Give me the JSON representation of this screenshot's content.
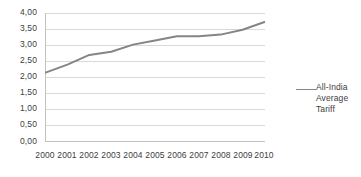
{
  "chart_data": {
    "type": "line",
    "title": "",
    "xlabel": "",
    "ylabel": "",
    "x": [
      2000,
      2001,
      2002,
      2003,
      2004,
      2005,
      2006,
      2007,
      2008,
      2009,
      2010
    ],
    "categories": [
      "2000",
      "2001",
      "2002",
      "2003",
      "2004",
      "2005",
      "2006",
      "2007",
      "2008",
      "2009",
      "2010"
    ],
    "series": [
      {
        "name": "All-India Average Tariff",
        "values": [
          2.15,
          2.4,
          2.7,
          2.8,
          3.02,
          3.15,
          3.28,
          3.28,
          3.33,
          3.48,
          3.72
        ],
        "color": "#858585"
      }
    ],
    "ylim": [
      0,
      4
    ],
    "ytick_step": 0.5,
    "ytick_labels": [
      "4,00",
      "3,50",
      "3,00",
      "2,50",
      "2,00",
      "1,50",
      "1,00",
      "0,50",
      "0,00"
    ],
    "ytick_values": [
      4.0,
      3.5,
      3.0,
      2.5,
      2.0,
      1.5,
      1.0,
      0.5,
      0.0
    ],
    "xtick_labels": [
      "2000",
      "2001",
      "2002",
      "2003",
      "2004",
      "2005",
      "2006",
      "2007",
      "2008",
      "2009",
      "2010"
    ],
    "grid": true,
    "grid_color": "#d9d9d9",
    "axis_color": "#bfbfbf",
    "legend_position": "right",
    "decimal_separator": ","
  },
  "legend": {
    "entries": [
      {
        "label": "All-India Average Tariff",
        "color": "#858585"
      }
    ]
  },
  "colors": {
    "series_line": "#858585",
    "gridline": "#d9d9d9",
    "axis": "#bfbfbf",
    "text": "#404040",
    "background": "#ffffff"
  }
}
